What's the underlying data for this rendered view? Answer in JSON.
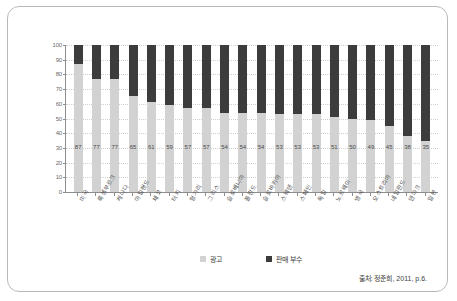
{
  "chart_data": {
    "type": "bar",
    "subtype": "stacked-percentage",
    "title": "",
    "xlabel": "",
    "ylabel": "",
    "ylim": [
      0,
      100
    ],
    "ytick_step": 10,
    "yticks": [
      0,
      10,
      20,
      30,
      40,
      50,
      60,
      70,
      80,
      90,
      100
    ],
    "grid": true,
    "legend_position": "bottom-center",
    "categories": [
      "미국",
      "룩셈부르크",
      "캐나다",
      "아일랜드",
      "체코",
      "터키",
      "헝가리",
      "그리스",
      "슬로베니아",
      "폴란드",
      "슬로바키아",
      "스웨덴",
      "스페인",
      "독일",
      "노르웨이",
      "영국",
      "오스트리아",
      "네덜란드",
      "덴마크",
      "일본"
    ],
    "series": [
      {
        "name": "광고",
        "color": "#d2d2d2",
        "values": [
          87,
          77,
          77,
          65,
          61,
          59,
          57,
          57,
          54,
          54,
          54,
          53,
          53,
          53,
          51,
          50,
          49,
          45,
          38,
          35
        ]
      },
      {
        "name": "판매 부수",
        "color": "#3c3c3c",
        "values": [
          13,
          23,
          23,
          35,
          39,
          41,
          43,
          43,
          46,
          46,
          46,
          47,
          47,
          47,
          49,
          50,
          51,
          55,
          62,
          65
        ]
      }
    ],
    "data_labels": [
      "87",
      "77",
      "77",
      "65",
      "61",
      "59",
      "57",
      "57",
      "54",
      "54",
      "54",
      "53",
      "53",
      "53",
      "51",
      "50",
      "49",
      "45",
      "38",
      "35"
    ]
  },
  "legend": {
    "items": [
      {
        "label": "광고",
        "color": "#d2d2d2"
      },
      {
        "label": "판매 부수",
        "color": "#3c3c3c"
      }
    ]
  },
  "source": {
    "text": "출처: 정준희, 2011, p.6."
  }
}
